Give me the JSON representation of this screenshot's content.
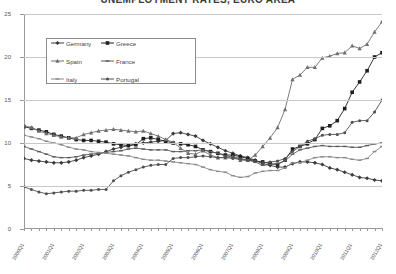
{
  "chart": {
    "title": "UNEMPLOYMENT RATES, EURO AREA",
    "legend_position": "top-left-inside"
  },
  "chart_data": {
    "type": "line",
    "title": "UNEMPLOYMENT RATES, EURO AREA",
    "xlabel": "",
    "ylabel": "",
    "ylim": [
      0,
      25
    ],
    "yticks": [
      0,
      5,
      10,
      15,
      20,
      25
    ],
    "grid": true,
    "legend": [
      "Germany",
      "Greece",
      "Spain",
      "France",
      "Italy",
      "Portugal"
    ],
    "x": [
      "2000Q1",
      "2000Q2",
      "2000Q3",
      "2000Q4",
      "2001Q1",
      "2001Q2",
      "2001Q3",
      "2001Q4",
      "2002Q1",
      "2002Q2",
      "2002Q3",
      "2002Q4",
      "2003Q1",
      "2003Q2",
      "2003Q3",
      "2003Q4",
      "2004Q1",
      "2004Q2",
      "2004Q3",
      "2004Q4",
      "2005Q1",
      "2005Q2",
      "2005Q3",
      "2005Q4",
      "2006Q1",
      "2006Q2",
      "2006Q3",
      "2006Q4",
      "2007Q1",
      "2007Q2",
      "2007Q3",
      "2007Q4",
      "2008Q1",
      "2008Q2",
      "2008Q3",
      "2008Q4",
      "2009Q1",
      "2009Q2",
      "2009Q3",
      "2009Q4",
      "2010Q1",
      "2010Q2",
      "2010Q3",
      "2010Q4",
      "2011Q1",
      "2011Q2",
      "2011Q3",
      "2011Q4",
      "2012Q1"
    ],
    "xtick_labels": [
      "2000Q1",
      "2001Q1",
      "2002Q1",
      "2003Q1",
      "2004Q1",
      "2005Q1",
      "2006Q1",
      "2007Q1",
      "2008Q1",
      "2009Q1",
      "2010Q1",
      "2011Q1",
      "2012Q1"
    ],
    "series": [
      {
        "name": "Germany",
        "color": "#3c3c3c",
        "marker": "diamond",
        "values": [
          8.2,
          8.0,
          7.9,
          7.8,
          7.7,
          7.7,
          7.8,
          8.0,
          8.3,
          8.5,
          8.7,
          9.0,
          9.3,
          9.5,
          9.7,
          9.9,
          10.0,
          10.1,
          10.2,
          10.3,
          11.1,
          11.2,
          11.0,
          10.8,
          10.3,
          9.9,
          9.5,
          9.1,
          8.8,
          8.5,
          8.3,
          8.0,
          7.6,
          7.4,
          7.2,
          7.2,
          7.6,
          7.8,
          7.8,
          7.7,
          7.5,
          7.1,
          6.9,
          6.6,
          6.3,
          6.0,
          5.9,
          5.7,
          5.6
        ]
      },
      {
        "name": "Greece",
        "color": "#1f1f1f",
        "marker": "square",
        "values": [
          11.9,
          11.7,
          11.5,
          11.3,
          11.0,
          10.8,
          10.6,
          10.4,
          10.3,
          10.3,
          10.2,
          10.1,
          9.9,
          9.8,
          9.7,
          9.8,
          10.5,
          10.6,
          10.4,
          10.2,
          10.0,
          9.9,
          9.8,
          9.6,
          9.2,
          9.0,
          8.8,
          8.6,
          8.6,
          8.4,
          8.2,
          7.9,
          7.8,
          7.6,
          7.5,
          8.0,
          9.3,
          9.6,
          9.9,
          10.4,
          11.7,
          12.0,
          12.6,
          14.0,
          15.9,
          17.1,
          18.4,
          20.0,
          20.5
        ]
      },
      {
        "name": "Spain",
        "color": "#6e6e6e",
        "marker": "triangle",
        "values": [
          12.0,
          11.8,
          11.4,
          11.1,
          10.9,
          10.7,
          10.6,
          10.6,
          11.0,
          11.2,
          11.4,
          11.5,
          11.6,
          11.5,
          11.4,
          11.3,
          11.4,
          11.1,
          10.8,
          10.4,
          10.1,
          9.4,
          8.8,
          8.7,
          9.1,
          8.6,
          8.3,
          8.3,
          8.4,
          8.0,
          8.0,
          8.6,
          9.6,
          10.6,
          11.8,
          13.9,
          17.4,
          17.9,
          18.8,
          18.8,
          19.9,
          20.1,
          20.4,
          20.5,
          21.3,
          21.0,
          21.5,
          22.9,
          24.1
        ]
      },
      {
        "name": "France",
        "color": "#5a5a5a",
        "marker": "dash",
        "values": [
          9.6,
          9.3,
          9.0,
          8.7,
          8.4,
          8.3,
          8.3,
          8.4,
          8.6,
          8.7,
          8.8,
          8.9,
          9.0,
          9.1,
          9.3,
          9.4,
          9.3,
          9.2,
          9.2,
          9.2,
          9.0,
          9.0,
          9.1,
          9.1,
          9.2,
          9.0,
          8.8,
          8.5,
          8.4,
          8.2,
          8.0,
          7.8,
          7.4,
          7.5,
          7.6,
          7.9,
          8.7,
          9.2,
          9.4,
          9.6,
          9.7,
          9.6,
          9.6,
          9.6,
          9.5,
          9.5,
          9.7,
          9.9,
          10.0
        ]
      },
      {
        "name": "Italy",
        "color": "#8a8a8a",
        "marker": "dash",
        "values": [
          10.9,
          10.7,
          10.5,
          10.2,
          10.0,
          9.8,
          9.5,
          9.3,
          9.2,
          9.0,
          8.9,
          8.8,
          8.7,
          8.6,
          8.5,
          8.3,
          8.1,
          8.0,
          8.0,
          7.9,
          7.8,
          7.7,
          7.6,
          7.5,
          7.2,
          6.9,
          6.7,
          6.6,
          6.2,
          6.0,
          6.1,
          6.5,
          6.7,
          6.8,
          6.8,
          7.1,
          7.7,
          7.7,
          8.0,
          8.3,
          8.4,
          8.4,
          8.3,
          8.3,
          8.1,
          8.0,
          8.2,
          9.0,
          9.6
        ]
      },
      {
        "name": "Portugal",
        "color": "#4f4f4f",
        "marker": "circle",
        "values": [
          4.9,
          4.6,
          4.3,
          4.1,
          4.2,
          4.3,
          4.4,
          4.4,
          4.5,
          4.5,
          4.6,
          4.6,
          5.6,
          6.2,
          6.6,
          6.9,
          7.2,
          7.4,
          7.5,
          7.5,
          8.2,
          8.3,
          8.3,
          8.4,
          8.5,
          8.4,
          8.3,
          8.3,
          8.2,
          8.1,
          8.0,
          7.9,
          7.7,
          7.8,
          7.9,
          8.2,
          9.0,
          9.6,
          10.2,
          10.5,
          10.9,
          11.0,
          11.0,
          11.2,
          12.4,
          12.6,
          12.6,
          13.6,
          15.0
        ]
      }
    ]
  }
}
